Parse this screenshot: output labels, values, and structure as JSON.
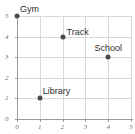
{
  "chart_data": {
    "type": "scatter",
    "title": "",
    "xlabel": "",
    "ylabel": "",
    "xlim": [
      0,
      5
    ],
    "ylim": [
      0,
      5
    ],
    "grid": true,
    "legend": "none",
    "x_ticks": [
      "0",
      "1",
      "2",
      "3",
      "4",
      "5"
    ],
    "y_ticks": [
      "0",
      "1",
      "2",
      "3",
      "4",
      "5"
    ],
    "point_color": "#4a4a4a",
    "grid_color": "#d8d8d8",
    "axis_color": "#9a9a9a",
    "points": [
      {
        "label": "Gym",
        "x": 0,
        "y": 5,
        "label_pos": "above-right"
      },
      {
        "label": "Track",
        "x": 2,
        "y": 4,
        "label_pos": "right"
      },
      {
        "label": "School",
        "x": 4,
        "y": 3,
        "label_pos": "above"
      },
      {
        "label": "Library",
        "x": 1,
        "y": 1,
        "label_pos": "above-right"
      }
    ]
  }
}
